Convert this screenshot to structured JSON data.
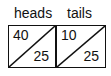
{
  "cells": [
    {
      "label": "heads",
      "top_value": "40",
      "bottom_value": "25"
    },
    {
      "label": "tails",
      "top_value": "10",
      "bottom_value": "25"
    }
  ]
}
